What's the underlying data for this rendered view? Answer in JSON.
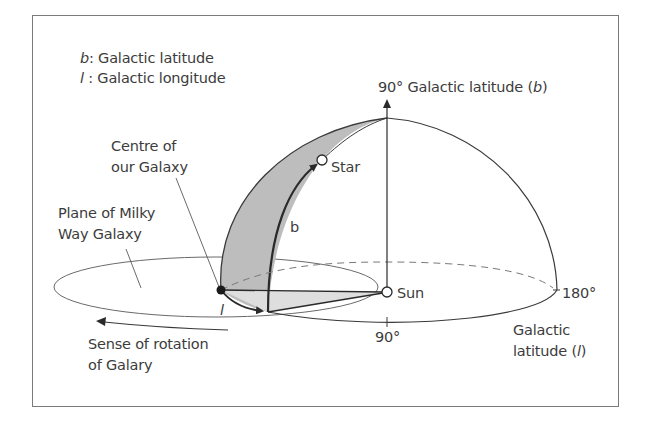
{
  "legend": {
    "b_symbol": "b",
    "b_text": ": Galactic latitude",
    "l_symbol": "l",
    "l_text": " : Galactic longitude"
  },
  "labels": {
    "zenith_prefix": "90° Galactic latitude (",
    "zenith_symbol": "b",
    "zenith_suffix": ")",
    "centre_line1": "Centre of",
    "centre_line2": "our Galaxy",
    "plane_line1": "Plane of Milky",
    "plane_line2": "Way Galaxy",
    "star": "Star",
    "b_arc": "b",
    "l_arc": "l",
    "sun": "Sun",
    "deg_180": "180°",
    "deg_90": "90°",
    "lon_line1": "Galactic",
    "lon_line2_prefix": "latitude (",
    "lon_symbol": "l",
    "lon_suffix": ")",
    "rotation_line1": "Sense of rotation",
    "rotation_line2": "of Galary"
  },
  "colors": {
    "line": "#3a3a3a",
    "shade": "#bdbdbd",
    "light_shade": "#dcdcdc",
    "frame": "#7a7a7a"
  }
}
